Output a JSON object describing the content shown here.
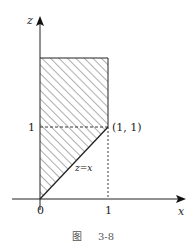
{
  "figure": {
    "caption_prefix": "图",
    "caption_number": "3-8"
  },
  "axes": {
    "x_label": "x",
    "z_label": "z",
    "origin_label": "0",
    "x_tick_label": "1",
    "z_tick_label": "1"
  },
  "annotations": {
    "point_label": "(1, 1)",
    "line_label": "z=x"
  },
  "colors": {
    "stroke": "#222222",
    "hatch": "#333333",
    "dashed": "#222222"
  }
}
